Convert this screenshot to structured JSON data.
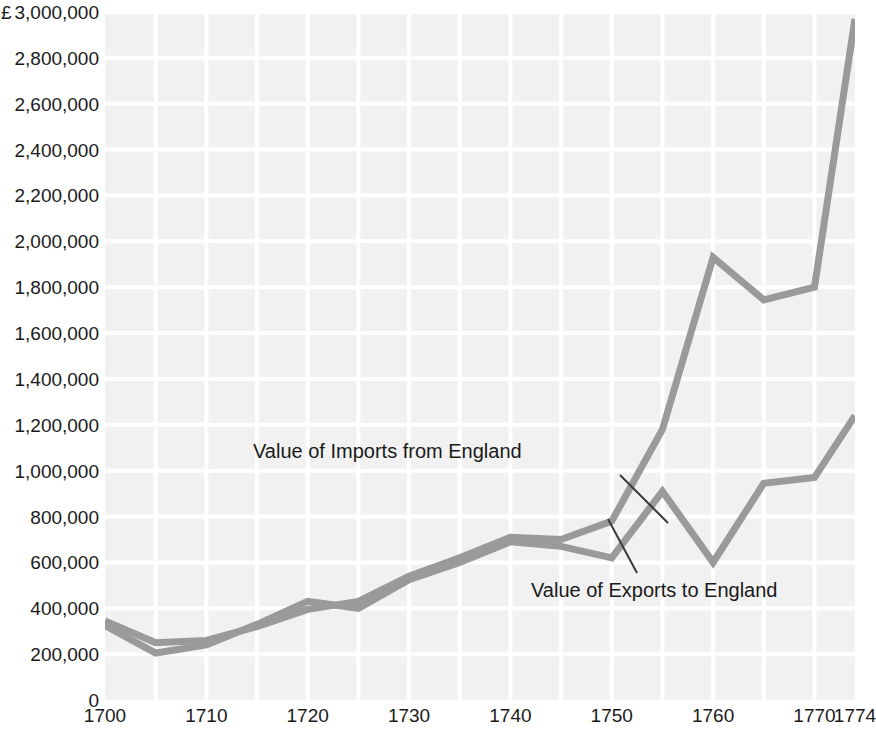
{
  "chart_data": {
    "type": "line",
    "title": "",
    "subtitle": "",
    "xlabel": "",
    "ylabel": "",
    "currency_symbol": "£",
    "x": [
      1700,
      1705,
      1710,
      1715,
      1720,
      1725,
      1730,
      1735,
      1740,
      1745,
      1750,
      1755,
      1760,
      1765,
      1770,
      1774
    ],
    "xlim": [
      1700,
      1774
    ],
    "ylim": [
      0,
      3000000
    ],
    "xticks": [
      1700,
      1710,
      1720,
      1730,
      1740,
      1750,
      1760,
      1770,
      1774
    ],
    "xtick_labels": [
      "1700",
      "1710",
      "1720",
      "1730",
      "1740",
      "1750",
      "1760",
      "1770",
      "1774"
    ],
    "yticks": [
      0,
      200000,
      400000,
      600000,
      800000,
      1000000,
      1200000,
      1400000,
      1600000,
      1800000,
      2000000,
      2200000,
      2400000,
      2600000,
      2800000,
      3000000
    ],
    "ytick_labels": [
      "0",
      "200,000",
      "400,000",
      "600,000",
      "800,000",
      "1,000,000",
      "1,200,000",
      "1,400,000",
      "1,600,000",
      "1,800,000",
      "2,000,000",
      "2,200,000",
      "2,400,000",
      "2,600,000",
      "2,800,000",
      "3,000,000"
    ],
    "ytick_top_prefix": "£",
    "grid": true,
    "grid_color": "#ffffff",
    "plot_background": "#f1f1f1",
    "legend_position": "inline-annotations",
    "series": [
      {
        "name": "Value of Imports from England",
        "color": "#9a9a9a",
        "values": [
          345000,
          250000,
          260000,
          320000,
          395000,
          430000,
          540000,
          620000,
          710000,
          700000,
          780000,
          1180000,
          1930000,
          1745000,
          1800000,
          2970000
        ]
      },
      {
        "name": "Value of Exports to England",
        "color": "#9a9a9a",
        "values": [
          325000,
          205000,
          240000,
          330000,
          430000,
          400000,
          525000,
          600000,
          690000,
          670000,
          620000,
          910000,
          600000,
          945000,
          970000,
          1240000
        ]
      }
    ],
    "annotations": [
      {
        "id": "imports",
        "text": "Value of Imports from England",
        "leader_from": [
          620,
          475
        ],
        "leader_to": [
          668,
          523
        ]
      },
      {
        "id": "exports",
        "text": "Value of Exports to England",
        "leader_from": [
          637,
          573
        ],
        "leader_to": [
          608,
          519
        ]
      }
    ]
  }
}
